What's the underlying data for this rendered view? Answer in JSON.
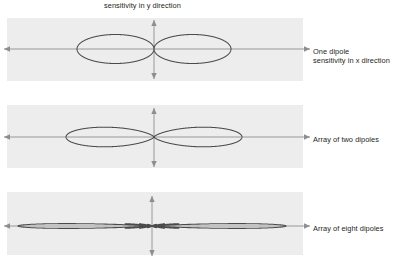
{
  "figure": {
    "top_caption": "sensitivity in y direction",
    "panels": [
      {
        "id": "one-dipole",
        "caption_lines": [
          "One dipole",
          "sensitivity in x direction"
        ],
        "caption_text": "One dipole sensitivity in x direction"
      },
      {
        "id": "array-two-dipoles",
        "caption_lines": [
          "Array of two dipoles"
        ],
        "caption_text": "Array of two dipoles"
      },
      {
        "id": "array-eight-dipoles",
        "caption_lines": [
          "Array of eight dipoles"
        ],
        "caption_text": "Array of eight dipoles"
      }
    ]
  },
  "chart_data": {
    "type": "line",
    "subtitle": "sensitivity in y direction",
    "xlabel": "sensitivity in x direction",
    "ylabel": "sensitivity in y direction",
    "grid": false,
    "legend_position": "right",
    "plot_style": "polar-lobe-pattern",
    "colors": {
      "panel_background": "#ededed",
      "axis": "#8e8e8e",
      "curve": "#4a4a4a",
      "text": "#231f20",
      "page_background": "#ffffff"
    },
    "panels": [
      {
        "name": "One dipole",
        "label": "One dipole sensitivity in x direction",
        "n_elements": 1,
        "pattern": "cos(theta)",
        "main_lobe_count": 2,
        "side_lobe_count": 0,
        "lobe_half_width_px": 77,
        "lobe_half_height_px": 29,
        "center_x_px": 154,
        "center_y_px": 49,
        "box": {
          "x": 7,
          "y": 18,
          "width": 296,
          "height": 63
        }
      },
      {
        "name": "Array of two dipoles",
        "label": "Array of two dipoles",
        "n_elements": 2,
        "pattern": "cos(theta)*cos((pi/2)*sin(theta))",
        "main_lobe_count": 2,
        "side_lobe_count": 0,
        "lobe_half_width_px": 88,
        "lobe_half_height_px": 32,
        "center_x_px": 154,
        "center_y_px": 137,
        "box": {
          "x": 7,
          "y": 105,
          "width": 296,
          "height": 63
        }
      },
      {
        "name": "Array of eight dipoles",
        "label": "Array of eight dipoles",
        "n_elements": 8,
        "pattern": "sin(8*u)/(8*sin(u))",
        "main_lobe_count": 2,
        "side_lobe_count": 14,
        "lobe_half_width_px": 134,
        "lobe_half_height_px": 30,
        "center_x_px": 152,
        "center_y_px": 226,
        "box": {
          "x": 7,
          "y": 192,
          "width": 296,
          "height": 63
        }
      }
    ],
    "axes": [
      {
        "panel": 0,
        "orientation": "horizontal",
        "x1": 4,
        "x2": 310,
        "y": 49,
        "arrows": "both"
      },
      {
        "panel": 0,
        "orientation": "vertical",
        "x": 154,
        "y1": 20,
        "y2": 79,
        "arrows": "both"
      },
      {
        "panel": 1,
        "orientation": "horizontal",
        "x1": 4,
        "x2": 310,
        "y": 137,
        "arrows": "both"
      },
      {
        "panel": 1,
        "orientation": "vertical",
        "x": 154,
        "y1": 108,
        "y2": 167,
        "arrows": "both"
      },
      {
        "panel": 2,
        "orientation": "horizontal",
        "x1": 4,
        "x2": 310,
        "y": 226,
        "arrows": "both"
      },
      {
        "panel": 2,
        "orientation": "vertical",
        "x": 152,
        "y1": 196,
        "y2": 256,
        "arrows": "both"
      }
    ]
  }
}
